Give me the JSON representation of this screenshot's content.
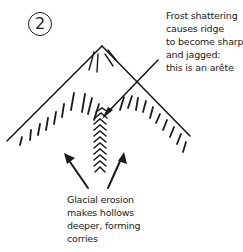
{
  "diagram": {
    "step_number": "2",
    "annotation_top": [
      "Frost shattering",
      "causes ridge",
      "to become sharp",
      "and jagged:",
      "this is an arête"
    ],
    "annotation_bottom": [
      "Glacial erosion",
      "makes hollows",
      "deeper, forming",
      "corries"
    ]
  }
}
